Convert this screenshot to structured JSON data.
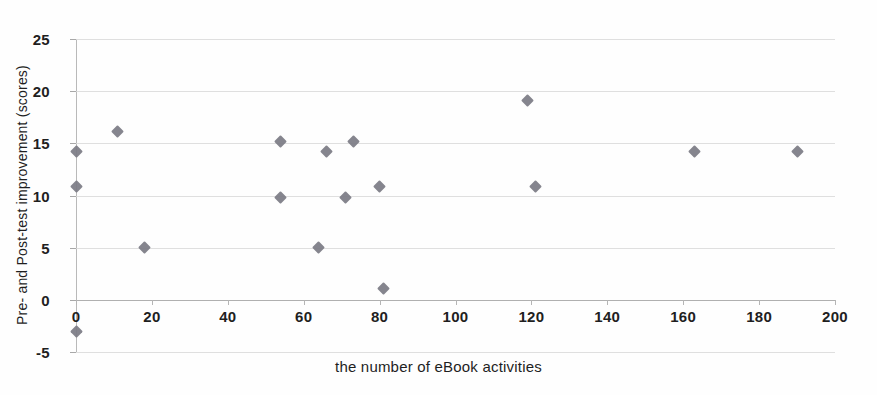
{
  "chart_data": {
    "type": "scatter",
    "title": "",
    "xlabel": "the number of eBook activities",
    "ylabel": "Pre- and Post-test improvement (scores)",
    "xlim": [
      0,
      200
    ],
    "ylim": [
      -5,
      25
    ],
    "xticks": [
      0,
      20,
      40,
      60,
      80,
      100,
      120,
      140,
      160,
      180,
      200
    ],
    "yticks": [
      -5,
      0,
      5,
      10,
      15,
      20,
      25
    ],
    "grid": "horizontal",
    "legend": "none",
    "marker": "diamond",
    "marker_color": "#7b7b84",
    "series": [
      {
        "name": "students",
        "points": [
          {
            "x": 0,
            "y": 14.2
          },
          {
            "x": 0,
            "y": 10.9
          },
          {
            "x": 0,
            "y": -3.0
          },
          {
            "x": 11,
            "y": 16.1
          },
          {
            "x": 18,
            "y": 5.0
          },
          {
            "x": 54,
            "y": 15.2
          },
          {
            "x": 54,
            "y": 9.8
          },
          {
            "x": 64,
            "y": 5.0
          },
          {
            "x": 66,
            "y": 14.2
          },
          {
            "x": 71,
            "y": 9.8
          },
          {
            "x": 73,
            "y": 15.2
          },
          {
            "x": 80,
            "y": 10.9
          },
          {
            "x": 81,
            "y": 1.1
          },
          {
            "x": 119,
            "y": 19.1
          },
          {
            "x": 121,
            "y": 10.9
          },
          {
            "x": 163,
            "y": 14.2
          },
          {
            "x": 190,
            "y": 14.2
          }
        ]
      }
    ]
  },
  "axes": {
    "x_title": "the number of eBook activities",
    "y_title": "Pre- and Post-test improvement (scores)",
    "x_tick_labels": [
      "0",
      "20",
      "40",
      "60",
      "80",
      "100",
      "120",
      "140",
      "160",
      "180",
      "200"
    ],
    "y_tick_labels": [
      "25",
      "20",
      "15",
      "10",
      "5",
      "0",
      "-5"
    ]
  },
  "colors": {
    "marker": "#7b7b84",
    "gridline": "#d9d9d9",
    "axis": "#b9b9b9",
    "text": "#1f1f1f",
    "background": "#fefefe"
  }
}
